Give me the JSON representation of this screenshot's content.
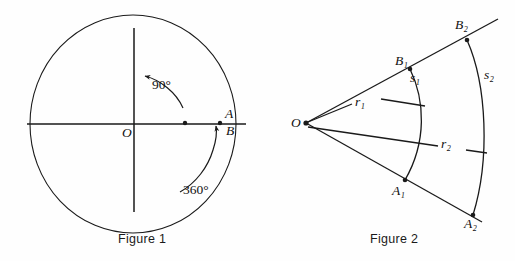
{
  "figures": [
    {
      "caption": "Figure 1",
      "description": "Circle centered at O with horizontal and vertical axes showing a 90 degree angle and a full 360 degree rotation",
      "labels": {
        "origin": "O",
        "point_a": "A",
        "point_b": "B",
        "angle_quarter": "90°",
        "angle_full": "360°"
      }
    },
    {
      "caption": "Figure 2",
      "description": "Angle with vertex O cut by two concentric arcs, showing radii r1 and r2 and arc lengths s1 and s2",
      "labels": {
        "vertex": "O",
        "point_b1": "B₁",
        "point_b2": "B₂",
        "point_a1": "A₁",
        "point_a2": "A₂",
        "arc_s1": "s₁",
        "arc_s2": "s₂",
        "radius_r1": "r₁",
        "radius_r2": "r₂"
      }
    }
  ],
  "colors": {
    "background": "#fefefe",
    "stroke": "#1a1a1a",
    "text": "#111111"
  }
}
